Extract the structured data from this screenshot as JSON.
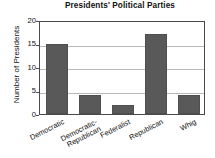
{
  "chart_data": {
    "type": "bar",
    "title": "Presidents' Political Parties",
    "xlabel": "",
    "ylabel": "Number of Presidents",
    "categories": [
      "Democratic",
      "Democratic-Republican",
      "Federalist",
      "Republican",
      "Whig"
    ],
    "category_lines": [
      [
        "Democratic"
      ],
      [
        "Democratic-",
        "Republican"
      ],
      [
        "Federalist"
      ],
      [
        "Republican"
      ],
      [
        "Whig"
      ]
    ],
    "values": [
      15,
      4,
      2,
      17,
      4
    ],
    "ylim": [
      0,
      20
    ],
    "yticks": [
      0,
      5,
      10,
      15,
      20
    ],
    "ytick_labels": [
      "0",
      "5",
      "10",
      "15",
      "20"
    ],
    "grid": true,
    "grid_axis": "y",
    "legend": false,
    "bar_color": "#595959",
    "grid_color": "#b9b9b9",
    "axis_color": "#4a4a4a",
    "text_color": "#111111",
    "background": "#ffffff"
  }
}
